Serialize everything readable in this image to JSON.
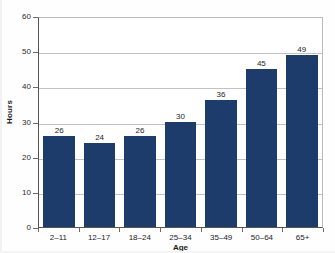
{
  "chart_data": {
    "type": "bar",
    "title": "",
    "xlabel": "Age",
    "ylabel": "Hours",
    "categories": [
      "2–11",
      "12–17",
      "18–24",
      "25–34",
      "35–49",
      "50–64",
      "65+"
    ],
    "values": [
      26,
      24,
      26,
      30,
      36,
      45,
      49
    ],
    "value_labels": [
      "26",
      "24",
      "26",
      "30",
      "36",
      "45",
      "49"
    ],
    "ylim": [
      0,
      60
    ],
    "ytick_values": [
      0,
      10,
      20,
      30,
      40,
      50,
      60
    ],
    "ytick_labels": [
      "0",
      "10",
      "20",
      "30",
      "40",
      "50",
      "60"
    ],
    "grid": "horizontal",
    "legend": "none",
    "series": [
      {
        "name": "Hours",
        "values": [
          26,
          24,
          26,
          30,
          36,
          45,
          49
        ]
      }
    ],
    "bar_color": "#1E3C6B",
    "gridline_color": "#C2C2C2",
    "axis_color": "#555555"
  },
  "chart": {
    "title_partial": "",
    "y_axis_label": "Hours",
    "x_axis_label": "Age"
  }
}
